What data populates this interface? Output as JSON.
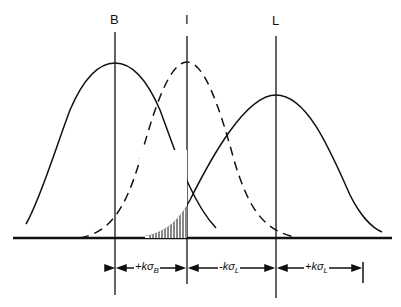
{
  "diagram": {
    "lines": [
      {
        "id": "B",
        "label": "B"
      },
      {
        "id": "I",
        "label": "I"
      },
      {
        "id": "L",
        "label": "L"
      }
    ],
    "dimensions": [
      {
        "label": "+kσ",
        "sub": "B"
      },
      {
        "label": "-kσ",
        "sub": "L"
      },
      {
        "label": "+kσ",
        "sub": "L"
      }
    ],
    "curves": [
      {
        "name": "B distribution",
        "style": "solid"
      },
      {
        "name": "I distribution",
        "style": "dashed"
      },
      {
        "name": "L distribution",
        "style": "solid"
      }
    ],
    "shaded_region": "overlap area between B and L tails left of I",
    "colors": {
      "ink": "#111111",
      "background": "#ffffff"
    }
  }
}
